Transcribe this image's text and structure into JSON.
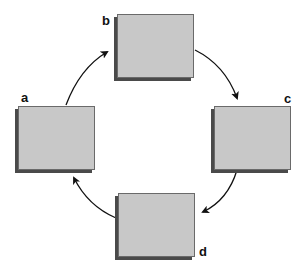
{
  "diagram": {
    "type": "cycle",
    "nodes": [
      {
        "id": "a",
        "label": "a"
      },
      {
        "id": "b",
        "label": "b"
      },
      {
        "id": "c",
        "label": "c"
      },
      {
        "id": "d",
        "label": "d"
      }
    ],
    "edges": [
      {
        "from": "a",
        "to": "b"
      },
      {
        "from": "b",
        "to": "c"
      },
      {
        "from": "c",
        "to": "d"
      },
      {
        "from": "d",
        "to": "a"
      }
    ],
    "colors": {
      "box_fill": "#c8c8c8",
      "box_border": "#6a6a6a",
      "shadow": "#4a4a4a",
      "arrow": "#111111"
    }
  }
}
